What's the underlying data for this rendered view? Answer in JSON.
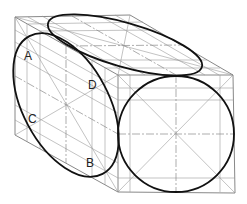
{
  "figure": {
    "labels": {
      "a": "A",
      "b": "B",
      "c": "C",
      "d": "D"
    },
    "colors": {
      "outline": "#111111",
      "construction": "#9a9a9a"
    }
  }
}
